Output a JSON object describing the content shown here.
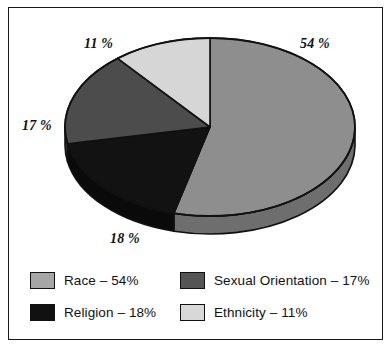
{
  "chart_data": {
    "type": "pie",
    "title": "",
    "subtitle": "",
    "xlabel": "",
    "ylabel": "",
    "legend_position": "bottom",
    "grid": false,
    "three_d": true,
    "categories": [
      "Race",
      "Religion",
      "Sexual Orientation",
      "Ethnicity"
    ],
    "values": [
      54,
      18,
      17,
      11
    ],
    "unit": "%",
    "slices": [
      {
        "label": "Race",
        "value": 54,
        "callout": "54 %",
        "legend_text": "Race – 54%",
        "color": "#8e8e8e",
        "side_color": "#6e6e6e",
        "swatch_color": "#a6a6a6"
      },
      {
        "label": "Religion",
        "value": 18,
        "callout": "18 %",
        "legend_text": "Religion – 18%",
        "color": "#121212",
        "side_color": "#0a0a0a",
        "swatch_color": "#111111"
      },
      {
        "label": "Sexual Orientation",
        "value": 17,
        "callout": "17 %",
        "legend_text": "Sexual Orientation – 17%",
        "color": "#4c4c4c",
        "side_color": "#3a3a3a",
        "swatch_color": "#555555"
      },
      {
        "label": "Ethnicity",
        "value": 11,
        "callout": "11 %",
        "legend_text": "Ethnicity – 11%",
        "color": "#d6d6d6",
        "side_color": "#b4b4b4",
        "swatch_color": "#d8d8d8"
      }
    ]
  },
  "callouts": {
    "race": "54 %",
    "religion": "18 %",
    "sexual_orientation": "17 %",
    "ethnicity": "11 %"
  },
  "legend": {
    "items": [
      {
        "label": "Race – 54%",
        "color": "#a6a6a6"
      },
      {
        "label": "Sexual Orientation – 17%",
        "color": "#555555"
      },
      {
        "label": "Religion – 18%",
        "color": "#111111"
      },
      {
        "label": "Ethnicity – 11%",
        "color": "#d8d8d8"
      }
    ]
  },
  "style": {
    "outline_color": "#111111",
    "frame_color": "#1a1a1a",
    "background": "#ffffff"
  }
}
